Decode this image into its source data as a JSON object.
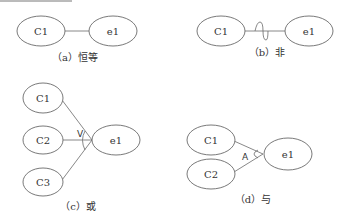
{
  "diagram": {
    "panels": [
      {
        "id": "a",
        "caption": "（a）恒等",
        "causes": [
          "C1"
        ],
        "effect": "e1",
        "relation": "identity",
        "symbol": ""
      },
      {
        "id": "b",
        "caption": "（b）非",
        "causes": [
          "C1"
        ],
        "effect": "e1",
        "relation": "not",
        "symbol": "~"
      },
      {
        "id": "c",
        "caption": "（c）或",
        "causes": [
          "C1",
          "C2",
          "C3"
        ],
        "effect": "e1",
        "relation": "or",
        "symbol": "V"
      },
      {
        "id": "d",
        "caption": "（d）与",
        "causes": [
          "C1",
          "C2"
        ],
        "effect": "e1",
        "relation": "and",
        "symbol": "A"
      }
    ]
  },
  "colors": {
    "line": "#6a6a6a",
    "text": "#333333",
    "background": "#ffffff"
  }
}
